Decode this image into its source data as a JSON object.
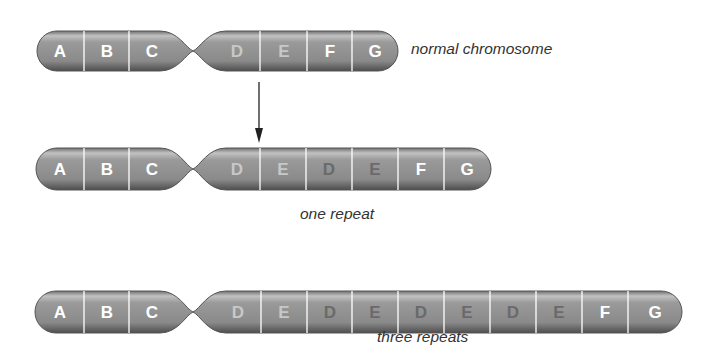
{
  "colors": {
    "body": "#8f8f8f",
    "body_light": "#c9c9c9",
    "body_dark": "#5a5a5a",
    "divider": "#ffffff",
    "label_white": "#ffffff",
    "label_light": "#c8c8c8",
    "label_dark": "#6a6a6a",
    "caption": "#333333"
  },
  "chromosomes": [
    {
      "id": "normal",
      "caption": "normal chromosome",
      "segments": [
        {
          "label": "A",
          "tone": "white"
        },
        {
          "label": "B",
          "tone": "white"
        },
        {
          "label": "C",
          "tone": "white"
        },
        {
          "label": "D",
          "tone": "light"
        },
        {
          "label": "E",
          "tone": "light"
        },
        {
          "label": "F",
          "tone": "white"
        },
        {
          "label": "G",
          "tone": "white"
        }
      ]
    },
    {
      "id": "one-repeat",
      "caption": "one repeat",
      "segments": [
        {
          "label": "A",
          "tone": "white"
        },
        {
          "label": "B",
          "tone": "white"
        },
        {
          "label": "C",
          "tone": "white"
        },
        {
          "label": "D",
          "tone": "light"
        },
        {
          "label": "E",
          "tone": "light"
        },
        {
          "label": "D",
          "tone": "dark"
        },
        {
          "label": "E",
          "tone": "dark"
        },
        {
          "label": "F",
          "tone": "white"
        },
        {
          "label": "G",
          "tone": "white"
        }
      ]
    },
    {
      "id": "three-repeats",
      "caption": "three repeats",
      "segments": [
        {
          "label": "A",
          "tone": "white"
        },
        {
          "label": "B",
          "tone": "white"
        },
        {
          "label": "C",
          "tone": "white"
        },
        {
          "label": "D",
          "tone": "light"
        },
        {
          "label": "E",
          "tone": "light"
        },
        {
          "label": "D",
          "tone": "dark"
        },
        {
          "label": "E",
          "tone": "dark"
        },
        {
          "label": "D",
          "tone": "dark"
        },
        {
          "label": "E",
          "tone": "dark"
        },
        {
          "label": "D",
          "tone": "dark"
        },
        {
          "label": "E",
          "tone": "dark"
        },
        {
          "label": "F",
          "tone": "white"
        },
        {
          "label": "G",
          "tone": "white"
        }
      ]
    }
  ],
  "arrow": {
    "icon": "down-arrow-icon"
  }
}
